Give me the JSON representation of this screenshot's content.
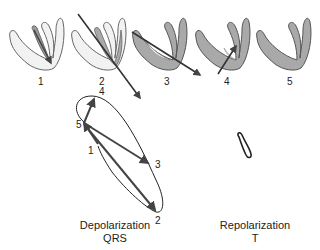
{
  "figure": {
    "heart_stages": [
      {
        "label": "1"
      },
      {
        "label": "2"
      },
      {
        "label": "3"
      },
      {
        "label": "4"
      },
      {
        "label": "5"
      }
    ],
    "vector_loop": {
      "points": [
        {
          "label": "1"
        },
        {
          "label": "2"
        },
        {
          "label": "3"
        },
        {
          "label": "4"
        },
        {
          "label": "5"
        }
      ]
    },
    "captions": {
      "depolarization": {
        "title": "Depolarization",
        "wave": "QRS"
      },
      "repolarization": {
        "title": "Repolarization",
        "wave": "T"
      }
    },
    "colors": {
      "depolarized_tissue": "#a9a9a9",
      "resting_tissue": "#f2f2f2",
      "outline": "#555555",
      "vector": "#444444"
    }
  }
}
